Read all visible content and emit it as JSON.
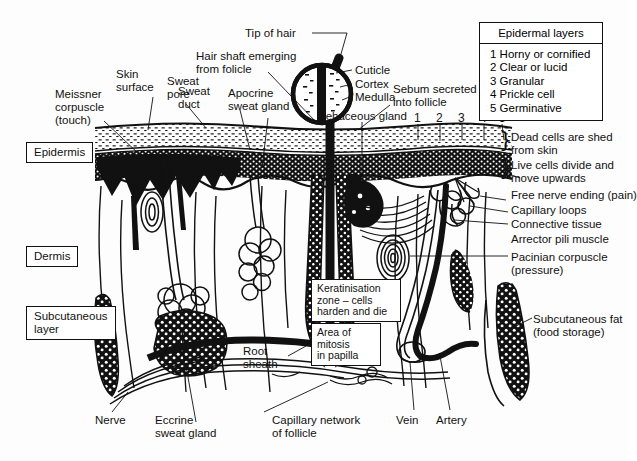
{
  "diagram": {
    "background": "#fdfdfd",
    "ink": "#111111"
  },
  "legend": {
    "heading": "Epidermal layers",
    "items": [
      "1 Horny or cornified",
      "2 Clear or lucid",
      "3 Granular",
      "4 Prickle cell",
      "5 Germinative"
    ]
  },
  "layer_numbers": [
    "1",
    "2",
    "3",
    "4",
    "5"
  ],
  "region_labels": [
    {
      "text": "Epidermis"
    },
    {
      "text": "Dermis"
    },
    {
      "text": "Subcutaneous\nlayer"
    }
  ],
  "labels_left": [
    {
      "text": "Meissner\ncorpuscle\n(touch)"
    },
    {
      "text": "Skin\nsurface"
    },
    {
      "text": "Sweat\npore"
    },
    {
      "text": "Sweat\nduct"
    },
    {
      "text": "Apocrine\nsweat gland"
    }
  ],
  "labels_top": [
    {
      "text": "Tip of hair"
    },
    {
      "text": "Hair shaft emerging\nfrom folicle"
    },
    {
      "text": "Cuticle"
    },
    {
      "text": "Cortex"
    },
    {
      "text": "Medulla"
    },
    {
      "text": "Sebum secreted\ninto follicle"
    },
    {
      "text": "Sebaceous gland"
    }
  ],
  "labels_right": [
    {
      "text": "Dead cells are shed\nfrom skin"
    },
    {
      "text": "Live cells divide and\nmove upwards"
    },
    {
      "text": "Free nerve ending (pain)"
    },
    {
      "text": "Capillary loops"
    },
    {
      "text": "Connective tissue"
    },
    {
      "text": "Arrector pili muscle"
    },
    {
      "text": "Pacinian corpuscle\n(pressure)"
    },
    {
      "text": "Subcutaneous fat\n(food storage)"
    }
  ],
  "callouts": [
    {
      "text": "Keratinisation\nzone – cells\nharden and die"
    },
    {
      "text": "Area of\nmitosis\nin papilla"
    }
  ],
  "labels_bottom": [
    {
      "text": "Nerve"
    },
    {
      "text": "Eccrine\nsweat gland"
    },
    {
      "text": "Root\nsheath"
    },
    {
      "text": "Capillary network\nof follicle"
    },
    {
      "text": "Vein"
    },
    {
      "text": "Artery"
    }
  ],
  "braces": [
    "}",
    "}"
  ]
}
